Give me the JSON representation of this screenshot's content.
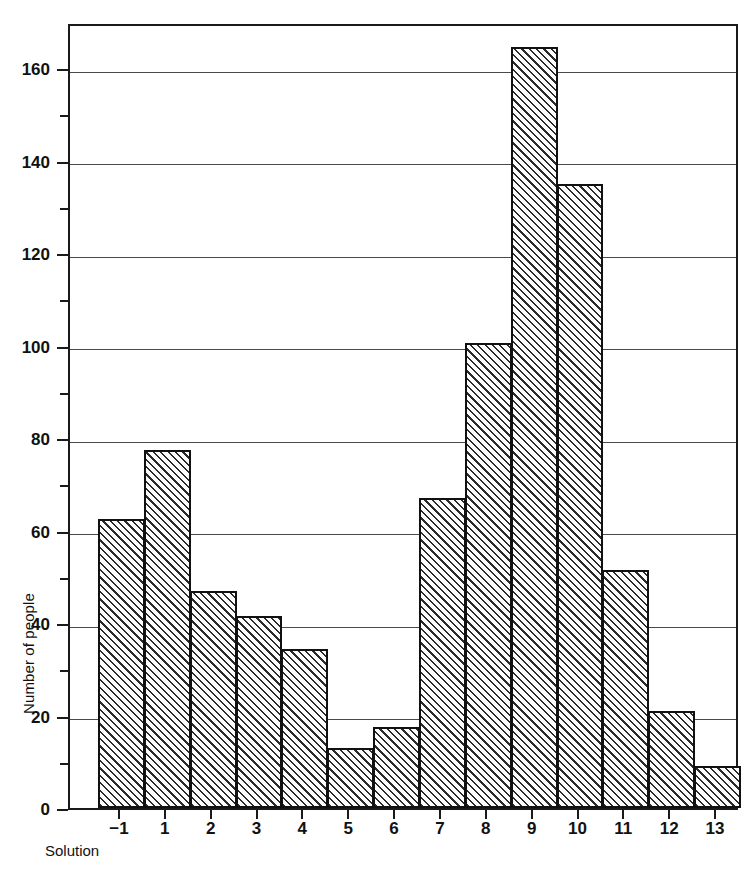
{
  "chart_data": {
    "type": "bar",
    "title": "",
    "subtitle": "",
    "xlabel": "Solution",
    "ylabel": "Number of people",
    "categories": [
      "-1",
      "1",
      "2",
      "3",
      "4",
      "5",
      "6",
      "7",
      "8",
      "9",
      "10",
      "11",
      "12",
      "13"
    ],
    "values": [
      62.5,
      77.5,
      47,
      41.5,
      34.5,
      13,
      17.5,
      67,
      100.5,
      164.5,
      135,
      51.5,
      21,
      9
    ],
    "ylim": [
      0,
      170
    ],
    "ytick_major": [
      0,
      20,
      40,
      60,
      80,
      100,
      120,
      140,
      160
    ],
    "ytick_major_labels": [
      "0",
      "20",
      "40",
      "60",
      "80",
      "100",
      "120",
      "140",
      "160"
    ],
    "ytick_minor": [
      10,
      30,
      50,
      70,
      90,
      110,
      130,
      150
    ],
    "grid": "horizontal",
    "legend": "none",
    "bar_style": {
      "fill": "diagonal-hatch",
      "hatch_direction": "45deg-up",
      "edge_color": "#111111",
      "face_color": "#ffffff"
    },
    "annotations": []
  },
  "axis": {
    "y_title": "Number of people",
    "x_title": "Solution"
  },
  "colors": {
    "ink": "#111111",
    "grid": "#4a4a4a",
    "background": "#ffffff"
  }
}
